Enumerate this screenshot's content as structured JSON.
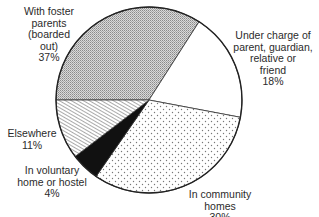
{
  "chart_data": {
    "type": "pie",
    "title": "",
    "categories": [
      "With foster parents (boarded out)",
      "Under charge of parent, guardian, relative or friend",
      "In community homes",
      "In voluntary home or hostel",
      "Elsewhere"
    ],
    "values": [
      37,
      18,
      30,
      4,
      11
    ],
    "unit": "%",
    "slices": [
      {
        "name": "With foster parents (boarded out)",
        "value": 37,
        "pattern": "fine-crosshatch-grey",
        "start_deg": 270,
        "end_deg": 392.6
      },
      {
        "name": "Under charge of parent, guardian, relative or friend",
        "value": 18,
        "pattern": "white",
        "start_deg": 32.6,
        "end_deg": 100.7
      },
      {
        "name": "In community homes",
        "value": 30,
        "pattern": "sparse-dots",
        "start_deg": 100.7,
        "end_deg": 214.7
      },
      {
        "name": "In voluntary home or hostel",
        "value": 4,
        "pattern": "solid-black",
        "start_deg": 214.7,
        "end_deg": 232.6
      },
      {
        "name": "Elsewhere",
        "value": 11,
        "pattern": "diagonal-hatch",
        "start_deg": 232.6,
        "end_deg": 270
      }
    ],
    "legend": "none (direct labels)"
  },
  "labels": {
    "foster": "With foster\nparents\n(boarded\nout)\n37%",
    "parent": "Under charge of\nparent, guardian,\nrelative or\nfriend\n18%",
    "community": "In community\nhomes\n30%",
    "voluntary": "In voluntary\nhome or hostel\n4%",
    "elsewhere": "Elsewhere\n11%"
  }
}
